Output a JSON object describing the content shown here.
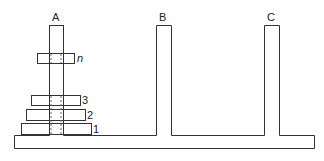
{
  "diagram": {
    "pegs": [
      {
        "label": "A"
      },
      {
        "label": "B"
      },
      {
        "label": "C"
      }
    ],
    "disks": [
      {
        "label": "n"
      },
      {
        "label": "3"
      },
      {
        "label": "2"
      },
      {
        "label": "1"
      }
    ],
    "colors": {
      "stroke": "#333333",
      "background": "#ffffff"
    }
  }
}
